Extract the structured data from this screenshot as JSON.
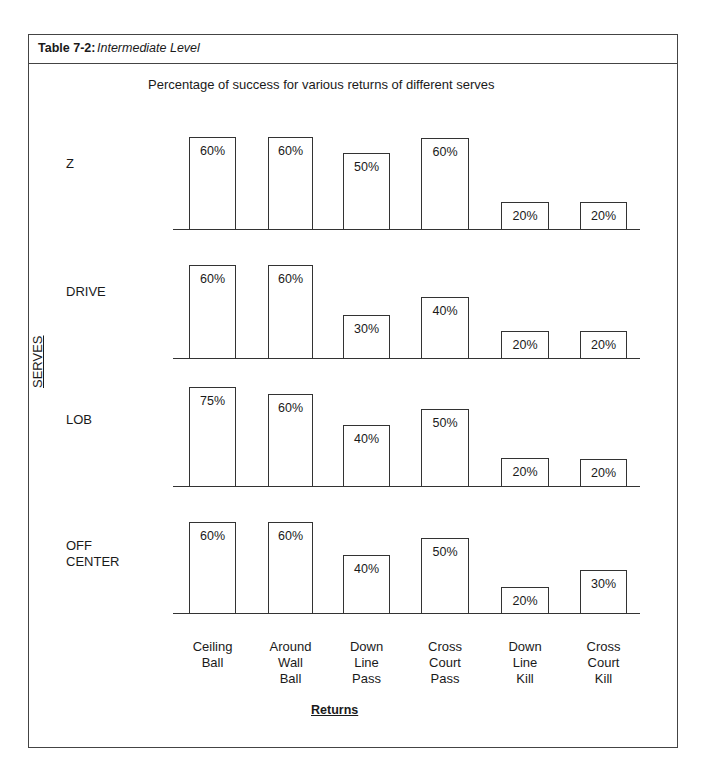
{
  "table": {
    "number": "Table 7-2:",
    "name": "Intermediate Level"
  },
  "subtitle": "Percentage of success for various returns of different serves",
  "y_axis_title": "SERVES",
  "x_axis_title": "Returns",
  "returns": [
    "Ceiling\nBall",
    "Around\nWall\nBall",
    "Down\nLine\nPass",
    "Cross\nCourt\nPass",
    "Down\nLine\nKill",
    "Cross\nCourt\nKill"
  ],
  "panels": [
    {
      "serve": "Z",
      "label_top": 156,
      "baseline": 229,
      "labels": [
        "60%",
        "60%",
        "50%",
        "60%",
        "20%",
        "20%"
      ],
      "bar_tops": [
        137,
        137,
        153,
        138,
        202,
        202
      ]
    },
    {
      "serve": "DRIVE",
      "label_top": 284,
      "baseline": 358,
      "labels": [
        "60%",
        "60%",
        "30%",
        "40%",
        "20%",
        "20%"
      ],
      "bar_tops": [
        265,
        265,
        315,
        297,
        331,
        331
      ]
    },
    {
      "serve": "LOB",
      "label_top": 412,
      "baseline": 486,
      "labels": [
        "75%",
        "60%",
        "40%",
        "50%",
        "20%",
        "20%"
      ],
      "bar_tops": [
        387,
        394,
        425,
        409,
        458,
        459
      ]
    },
    {
      "serve": "OFF\nCENTER",
      "label_top": 538,
      "baseline": 613,
      "labels": [
        "60%",
        "60%",
        "40%",
        "50%",
        "20%",
        "30%"
      ],
      "bar_tops": [
        522,
        522,
        555,
        538,
        587,
        570
      ]
    }
  ],
  "chart_data": {
    "type": "bar",
    "xlabel": "Returns",
    "ylabel": "SERVES",
    "categories": [
      "Ceiling Ball",
      "Around Wall Ball",
      "Down Line Pass",
      "Cross Court Pass",
      "Down Line Kill",
      "Cross Court Kill"
    ],
    "series": [
      {
        "name": "Z",
        "values": [
          60,
          60,
          50,
          60,
          20,
          20
        ]
      },
      {
        "name": "DRIVE",
        "values": [
          60,
          60,
          30,
          40,
          20,
          20
        ]
      },
      {
        "name": "LOB",
        "values": [
          75,
          60,
          40,
          50,
          20,
          20
        ]
      },
      {
        "name": "OFF CENTER",
        "values": [
          60,
          60,
          40,
          50,
          20,
          30
        ]
      }
    ],
    "unit": "%",
    "layout": "small multiples, one bar panel per serve, data labels inside bars, no gridlines, no y-axis ticks"
  }
}
